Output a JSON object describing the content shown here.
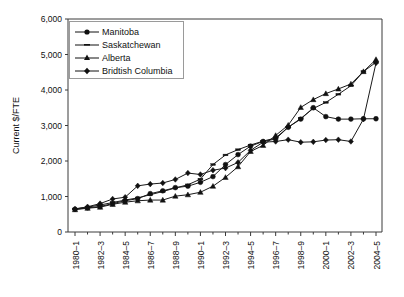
{
  "chart_data": {
    "type": "line",
    "title": "",
    "xlabel": "",
    "ylabel": "Current $/FTE",
    "ylim": [
      0,
      6000
    ],
    "ytick_labels": [
      "6,000",
      "5,000",
      "4,000",
      "3,000",
      "2,000",
      "1,000",
      "0"
    ],
    "ytick_values": [
      6000,
      5000,
      4000,
      3000,
      2000,
      1000,
      0
    ],
    "grid": false,
    "legend_position": "top-left",
    "categories": [
      "1980–1",
      "1981–2",
      "1982–3",
      "1983–4",
      "1984–5",
      "1985–6",
      "1986–7",
      "1987–8",
      "1988–9",
      "1989–90",
      "1990–1",
      "1991–2",
      "1992–3",
      "1993–4",
      "1994–5",
      "1995–6",
      "1996–7",
      "1997–8",
      "1998–9",
      "1999–2000",
      "2000–1",
      "2001–2",
      "2002–3",
      "2003–4",
      "2004–5"
    ],
    "xtick_labels": [
      "1980–1",
      "1982–3",
      "1984–5",
      "1986–7",
      "1988–9",
      "1990–1",
      "1992–3",
      "1994–5",
      "1996–7",
      "1998–9",
      "2000–1",
      "2002–3",
      "2004–5"
    ],
    "xtick_indices": [
      0,
      2,
      4,
      6,
      8,
      10,
      12,
      14,
      16,
      18,
      20,
      22,
      24
    ],
    "series": [
      {
        "name": "Manitoba",
        "marker": "circle",
        "values": [
          640,
          680,
          720,
          800,
          880,
          940,
          1080,
          1160,
          1250,
          1290,
          1400,
          1560,
          1900,
          2180,
          2420,
          2550,
          2620,
          2950,
          3180,
          3500,
          3250,
          3180,
          3180,
          3190,
          3190
        ]
      },
      {
        "name": "Saskatchewan",
        "marker": "dash",
        "values": [
          650,
          700,
          760,
          830,
          900,
          960,
          1050,
          1140,
          1240,
          1330,
          1490,
          1900,
          2170,
          2320,
          2450,
          2560,
          2650,
          2950,
          3200,
          3480,
          3650,
          3880,
          4120,
          4520,
          4780
        ]
      },
      {
        "name": "Alberta",
        "marker": "triangle",
        "values": [
          630,
          670,
          700,
          780,
          840,
          880,
          900,
          900,
          1010,
          1050,
          1120,
          1290,
          1540,
          1840,
          2270,
          2440,
          2720,
          3010,
          3510,
          3730,
          3900,
          4030,
          4170,
          4520,
          4860
        ]
      },
      {
        "name": "Bridtish Columbia",
        "marker": "diamond",
        "values": [
          650,
          710,
          800,
          930,
          980,
          1300,
          1350,
          1380,
          1480,
          1660,
          1620,
          1740,
          1800,
          1960,
          2300,
          2530,
          2550,
          2600,
          2530,
          2540,
          2590,
          2600,
          2550,
          3180,
          4760
        ]
      }
    ]
  },
  "legend": {
    "entries": [
      {
        "label": "Manitoba",
        "marker": "circle"
      },
      {
        "label": "Saskatchewan",
        "marker": "dash"
      },
      {
        "label": "Alberta",
        "marker": "triangle"
      },
      {
        "label": "Bridtish Columbia",
        "marker": "diamond"
      }
    ]
  },
  "axes": {
    "y_axis_title": "Current $/FTE"
  }
}
